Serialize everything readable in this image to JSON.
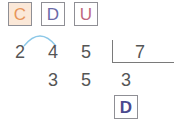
{
  "header_boxes": [
    {
      "label": "C",
      "color": "#e8955a",
      "bg": "#fbe8d8"
    },
    {
      "label": "D",
      "color": "#6b6aa8",
      "bg": "#ffffff"
    },
    {
      "label": "U",
      "color": "#c0667e",
      "bg": "#ffffff"
    }
  ],
  "dividend": [
    "2",
    "4",
    "5"
  ],
  "divisor": "7",
  "remainder_row": [
    "3",
    "5"
  ],
  "quotient_digit": "3",
  "quotient_box": {
    "label": "D",
    "color": "#4a4a8f"
  },
  "arc_color": "#8cc8e8"
}
